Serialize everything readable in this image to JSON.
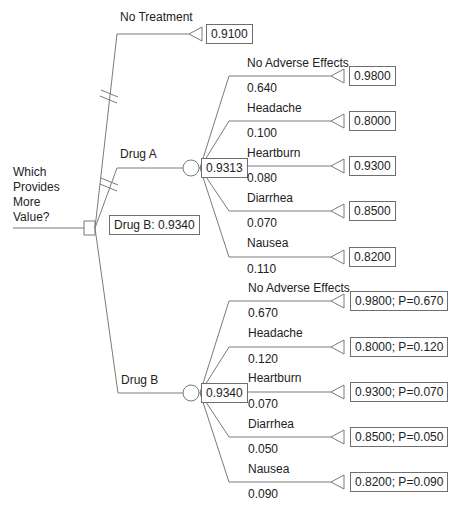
{
  "decision": {
    "question": [
      "Which",
      "Provides",
      "More",
      "Value?"
    ],
    "best_label": "Drug B: 0.9340"
  },
  "branches": {
    "no_treatment": {
      "label": "No Treatment",
      "value": "0.9100"
    },
    "drug_a": {
      "label": "Drug A",
      "expected_value": "0.9313",
      "outcomes": [
        {
          "label": "No Adverse Effects",
          "prob": "0.640",
          "value": "0.9800"
        },
        {
          "label": "Headache",
          "prob": "0.100",
          "value": "0.8000"
        },
        {
          "label": "Heartburn",
          "prob": "0.080",
          "value": "0.9300"
        },
        {
          "label": "Diarrhea",
          "prob": "0.070",
          "value": "0.8500"
        },
        {
          "label": "Nausea",
          "prob": "0.110",
          "value": "0.8200"
        }
      ]
    },
    "drug_b": {
      "label": "Drug B",
      "expected_value": "0.9340",
      "outcomes": [
        {
          "label": "No Adverse Effects",
          "prob": "0.670",
          "value": "0.9800; P=0.670"
        },
        {
          "label": "Headache",
          "prob": "0.120",
          "value": "0.8000; P=0.120"
        },
        {
          "label": "Heartburn",
          "prob": "0.070",
          "value": "0.9300; P=0.070"
        },
        {
          "label": "Diarrhea",
          "prob": "0.050",
          "value": "0.8500; P=0.050"
        },
        {
          "label": "Nausea",
          "prob": "0.090",
          "value": "0.8200; P=0.090"
        }
      ]
    }
  },
  "colors": {
    "line": "#7a7a7a",
    "text": "#222222"
  }
}
